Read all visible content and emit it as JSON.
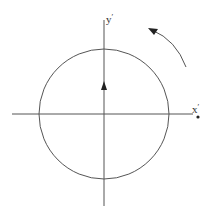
{
  "diagram": {
    "type": "rotating-frame",
    "axes": {
      "x_label": "x",
      "y_label": "y",
      "prime_mark": "′"
    },
    "circle": {
      "cx": 104,
      "cy": 114,
      "r": 65
    },
    "vector_arrow": {
      "direction": "up",
      "description": "velocity arrow on y-axis"
    },
    "rotation_arrow": {
      "direction": "counterclockwise"
    },
    "point_marker": {
      "description": "dot near x′ axis end"
    },
    "colors": {
      "line": "#555555",
      "arrow": "#222222",
      "background": "#ffffff"
    }
  }
}
